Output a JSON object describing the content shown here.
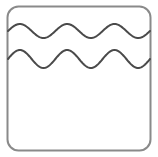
{
  "canvas": {
    "width": 158,
    "height": 157,
    "background_color": "#ffffff"
  },
  "icon": {
    "name": "water-waves-icon",
    "description": "Rounded square card outline containing two horizontal wavy lines in the upper third",
    "label": "",
    "frame": {
      "name": "rounded-square-frame",
      "x": 7.5,
      "y": 6.5,
      "width": 143,
      "height": 144,
      "corner_radius": 11,
      "stroke_color": "#8a8a8a",
      "stroke_width": 2,
      "fill_color": "#ffffff"
    },
    "waves": [
      {
        "name": "wave-line-upper",
        "baseline_y": 31,
        "amplitude": 7,
        "periods": 3,
        "phase_deg": 180,
        "stroke_color": "#4a4a4a",
        "stroke_width": 2,
        "x_start": 8,
        "x_end": 150
      },
      {
        "name": "wave-line-lower",
        "baseline_y": 59,
        "amplitude": 9,
        "periods": 3,
        "phase_deg": 180,
        "stroke_color": "#4a4a4a",
        "stroke_width": 2,
        "x_start": 8,
        "x_end": 150
      }
    ]
  }
}
